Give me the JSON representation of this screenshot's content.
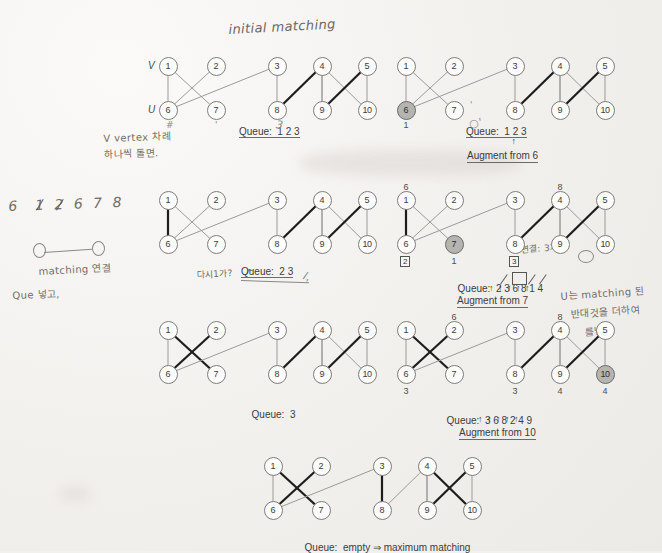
{
  "document": {
    "title": "initial matching",
    "type": "handwritten-annotated bipartite matching algorithm figure",
    "axis_labels": {
      "top": "V",
      "bottom": "U"
    }
  },
  "colors": {
    "paper": "#f3f1ee",
    "ink": "#3c3c3c",
    "node_fill": "#fdfdfb",
    "node_highlight": "#b6b4b1",
    "edge_thin": "#9a9a9a",
    "edge_bold": "#1d1d1d",
    "handwriting": "#6f6d6a"
  },
  "graphs": [
    {
      "id": "g1",
      "caption": "Queue:  1 2 3",
      "augment": null,
      "arrows": null,
      "top_nodes": [
        "1",
        "2",
        "3",
        "4",
        "5"
      ],
      "bottom_nodes": [
        "6",
        "7",
        "8",
        "9",
        "10"
      ],
      "highlight": [],
      "edges_thin": [
        "1-6",
        "1-7",
        "2-6",
        "3-6",
        "3-8",
        "4-9",
        "4-10",
        "5-10"
      ],
      "edges_bold": [
        "4-8",
        "5-9"
      ],
      "node_numbers": {}
    },
    {
      "id": "g2",
      "caption": "Queue:  1 2 3",
      "augment": "Augment from 6",
      "arrows": " ↑",
      "top_nodes": [
        "1",
        "2",
        "3",
        "4",
        "5"
      ],
      "bottom_nodes": [
        "6",
        "7",
        "8",
        "9",
        "10"
      ],
      "highlight": [
        "6"
      ],
      "edges_thin": [
        "1-6",
        "1-7",
        "2-6",
        "3-6",
        "3-8",
        "4-9",
        "4-10",
        "5-10"
      ],
      "edges_bold": [
        "4-8",
        "5-9"
      ],
      "node_numbers": {
        "6": "1"
      }
    },
    {
      "id": "g3",
      "caption": "Queue:  2 3",
      "augment": null,
      "arrows": null,
      "top_nodes": [
        "1",
        "2",
        "3",
        "4",
        "5"
      ],
      "bottom_nodes": [
        "6",
        "7",
        "8",
        "9",
        "10"
      ],
      "highlight": [],
      "edges_thin": [
        "1-7",
        "2-6",
        "3-6",
        "3-8",
        "4-9",
        "4-10",
        "5-10"
      ],
      "edges_bold": [
        "1-6",
        "4-8",
        "5-9"
      ],
      "node_numbers": {}
    },
    {
      "id": "g4",
      "caption": "Queue:  2 3 6 8 1 4",
      "queue_tokens": [
        "2",
        "3",
        "6",
        "8",
        "1",
        "4"
      ],
      "queue_struck": [
        "3",
        "8",
        "1"
      ],
      "queue_boxed": [
        "6"
      ],
      "augment": "Augment from 7",
      "arrows": "↑ ↑ ↑ ↑ ↑",
      "top_nodes": [
        "1",
        "2",
        "3",
        "4",
        "5"
      ],
      "bottom_nodes": [
        "6",
        "7",
        "8",
        "9",
        "10"
      ],
      "highlight": [
        "7"
      ],
      "edges_thin": [
        "1-7",
        "2-6",
        "3-6",
        "3-8",
        "4-9",
        "4-10",
        "5-10"
      ],
      "edges_bold": [
        "1-6",
        "4-8",
        "5-9"
      ],
      "node_numbers": {
        "7": "1"
      },
      "node_boxes": {
        "6": "2",
        "8": "3"
      },
      "top_numbers": {
        "1": "6",
        "4": "8"
      }
    },
    {
      "id": "g5",
      "caption": "Queue:  3",
      "augment": null,
      "arrows": null,
      "top_nodes": [
        "1",
        "2",
        "3",
        "4",
        "5"
      ],
      "bottom_nodes": [
        "6",
        "7",
        "8",
        "9",
        "10"
      ],
      "highlight": [],
      "edges_thin": [
        "1-6",
        "3-6",
        "4-9",
        "4-10",
        "5-10"
      ],
      "edges_bold": [
        "1-7",
        "2-6",
        "4-8",
        "5-9"
      ],
      "node_numbers": {}
    },
    {
      "id": "g6",
      "caption": "Queue:  3 6 8 2 4 9",
      "queue_tokens": [
        "3",
        "6",
        "8",
        "2",
        "4",
        "9"
      ],
      "augment": "Augment from 10",
      "arrows": "↑ ↑ ↑ ↑ ↑",
      "top_nodes": [
        "1",
        "2",
        "3",
        "4",
        "5"
      ],
      "bottom_nodes": [
        "6",
        "7",
        "8",
        "9",
        "10"
      ],
      "highlight": [
        "10"
      ],
      "edges_thin": [
        "1-6",
        "3-6",
        "4-9",
        "5-10"
      ],
      "edges_bold": [
        "1-7",
        "2-6",
        "3-8",
        "4-8",
        "5-9"
      ],
      "node_numbers": {
        "6": "3",
        "8": "3",
        "9": "4",
        "10": "4"
      },
      "top_numbers": {
        "2": "6",
        "4": "8"
      }
    },
    {
      "id": "g7",
      "caption": "Queue:  empty ⇒ maximum matching",
      "augment": null,
      "arrows": null,
      "top_nodes": [
        "1",
        "2",
        "3",
        "4",
        "5"
      ],
      "bottom_nodes": [
        "6",
        "7",
        "8",
        "9",
        "10"
      ],
      "highlight": [],
      "edges_thin": [
        "1-6",
        "3-6",
        "4-9",
        "5-10"
      ],
      "edges_bold": [
        "1-7",
        "2-6",
        "3-8",
        "4-10",
        "5-9"
      ],
      "node_numbers": {}
    }
  ],
  "handwriting": [
    {
      "id": "hw-title",
      "text": "initial matching"
    },
    {
      "id": "hw-v-vertex",
      "text": "V vertex 차례"
    },
    {
      "id": "hw-v-vertex2",
      "text": "하나씩 돌면."
    },
    {
      "id": "hw-seq",
      "text": "6  1 2 6 7 8"
    },
    {
      "id": "hw-matching",
      "text": "matching 연결"
    },
    {
      "id": "hw-queue",
      "text": "Que 넣고,"
    },
    {
      "id": "hw-dangi",
      "text": "다시1가?"
    },
    {
      "id": "hw-ut",
      "text": "U는 matching 된"
    },
    {
      "id": "hw-ut2",
      "text": "반대것을 더하여"
    },
    {
      "id": "hw-ut3",
      "text": "를넣"
    },
    {
      "id": "hw-eff",
      "text": "연결: 3개"
    }
  ]
}
